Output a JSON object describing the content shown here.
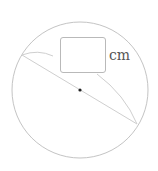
{
  "diagram": {
    "circle": {
      "cx": 80,
      "cy": 90,
      "r": 68,
      "stroke": "#c4c4c4"
    },
    "center_point": {
      "cx": 80,
      "cy": 90,
      "r": 1.6,
      "fill": "#222222"
    },
    "chord": {
      "x1": 22,
      "y1": 55,
      "x2": 137,
      "y2": 124,
      "stroke": "#cfcfcf"
    },
    "leader_arcs": [
      {
        "d": "M22,55 Q38,49 53,56",
        "stroke": "#cfcfcf"
      },
      {
        "d": "M97,74 Q125,95 137,124",
        "stroke": "#cfcfcf"
      }
    ],
    "answer_box": {
      "value": ""
    },
    "unit_label": "cm"
  }
}
